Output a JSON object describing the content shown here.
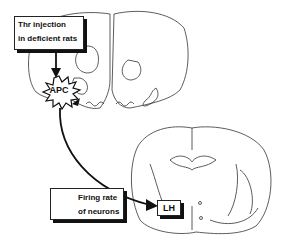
{
  "diagram": {
    "stimulus_box": {
      "line1": "Thr injection",
      "line2": "in deficient rats"
    },
    "source_region": {
      "label": "APC"
    },
    "effect_box": {
      "icon": "up-arrow-icon",
      "line1": "Firing rate",
      "line2": "of neurons"
    },
    "target_region": {
      "label": "LH"
    },
    "colors": {
      "ink": "#111111",
      "background": "#ffffff"
    }
  }
}
